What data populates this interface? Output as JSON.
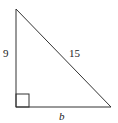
{
  "figure": {
    "type": "right-triangle",
    "labels": {
      "left_leg": "9",
      "hypotenuse": "15",
      "base": "b"
    },
    "right_angle_marker": true,
    "colors": {
      "stroke": "#333333",
      "background": "#ffffff"
    }
  }
}
